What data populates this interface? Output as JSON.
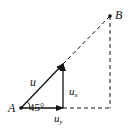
{
  "diagram": {
    "type": "vector-decomposition",
    "points": [
      {
        "id": "A",
        "label": "A",
        "x": 21,
        "y": 108
      },
      {
        "id": "B",
        "label": "B",
        "x": 110,
        "y": 16
      }
    ],
    "vectors": [
      {
        "id": "u",
        "label": "u",
        "from": [
          21,
          108
        ],
        "to": [
          63,
          64
        ]
      },
      {
        "id": "ux",
        "label": "u",
        "subscript": "x",
        "from": [
          63,
          108
        ],
        "to": [
          63,
          64
        ]
      },
      {
        "id": "uy",
        "label": "u",
        "subscript": "y",
        "from": [
          21,
          108
        ],
        "to": [
          63,
          108
        ]
      }
    ],
    "angle": {
      "value": "45°",
      "vertex": "A"
    },
    "dashed_lines": [
      "A-B extension",
      "B vertical",
      "horizontal base"
    ],
    "colors": {
      "stroke": "#111111",
      "background": "#ffffff"
    }
  }
}
